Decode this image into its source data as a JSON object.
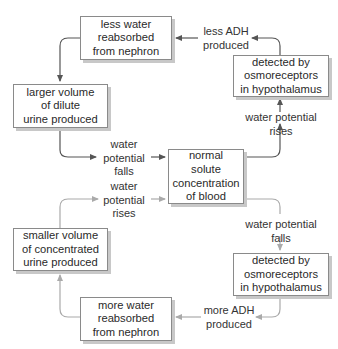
{
  "diagram": {
    "title": "",
    "colors": {
      "upper_loop": "#555555",
      "lower_loop": "#a8a8a8",
      "box_border": "#8a8a8a",
      "box_shadow": "#c8c8c8"
    },
    "center": {
      "lines": [
        "normal",
        "solute",
        "concentration",
        "of blood"
      ]
    },
    "upper_loop": {
      "rise_label": [
        "water potential",
        "rises"
      ],
      "detect_box": [
        "detected by",
        "osmoreceptors",
        "in hypothalamus"
      ],
      "adh_label": [
        "less ADH",
        "produced"
      ],
      "reabsorb_box": [
        "less water",
        "reabsorbed",
        "from nephron"
      ],
      "urine_box": [
        "larger volume",
        "of dilute",
        "urine produced"
      ],
      "fall_label": [
        "water",
        "potential",
        "falls"
      ]
    },
    "lower_loop": {
      "fall_label": [
        "water potential",
        "falls"
      ],
      "detect_box": [
        "detected by",
        "osmoreceptors",
        "in hypothalamus"
      ],
      "adh_label": [
        "more ADH",
        "produced"
      ],
      "reabsorb_box": [
        "more water",
        "reabsorbed",
        "from nephron"
      ],
      "urine_box": [
        "smaller volume",
        "of concentrated",
        "urine produced"
      ],
      "rise_label": [
        "water",
        "potential",
        "rises"
      ]
    }
  }
}
